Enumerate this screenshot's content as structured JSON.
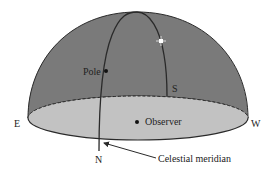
{
  "labels": {
    "east": "E",
    "west": "W",
    "north": "N",
    "south": "S",
    "pole": "Pole",
    "observer": "Observer",
    "meridian": "Celestial meridian"
  },
  "colors": {
    "dome": "#7a7a7a",
    "horizon_plane": "#c2c2c2",
    "outline": "#2a2a2a",
    "star": "#ffffff"
  },
  "icons": {
    "star": "star-icon",
    "pole_dot": "pole-marker",
    "observer_dot": "observer-marker"
  }
}
